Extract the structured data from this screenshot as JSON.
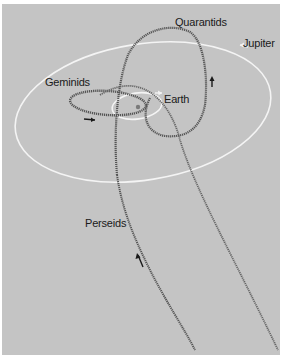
{
  "diagram": {
    "labels": {
      "quarantids": "Quarantids",
      "jupiter": "Jupiter",
      "geminids": "Geminids",
      "earth": "Earth",
      "perseids": "Perseids"
    },
    "colors": {
      "background": "#c4c4c4",
      "planet_orbit": "#ffffff",
      "meteor_stream": "#5a5a5a",
      "direction_arrow": "#1a1a1a"
    }
  }
}
